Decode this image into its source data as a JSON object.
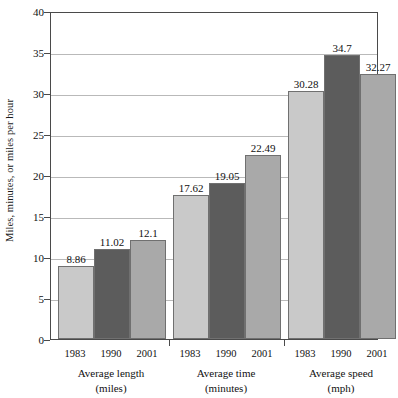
{
  "chart_data": {
    "type": "bar",
    "title": "",
    "subtitle": "",
    "xlabel": "",
    "ylabel": "Miles, minutes, or miles per hour",
    "ylim": [
      0,
      40
    ],
    "ytick_step": 5,
    "yticks": [
      "0",
      "5",
      "10",
      "15",
      "20",
      "25",
      "30",
      "35",
      "40"
    ],
    "grid": true,
    "legend": "none",
    "categories": [
      {
        "line1": "Average length",
        "line2": "(miles)"
      },
      {
        "line1": "Average time",
        "line2": "(minutes)"
      },
      {
        "line1": "Average speed",
        "line2": "(mph)"
      }
    ],
    "series": [
      {
        "name": "1983",
        "color": "#c9c9c9",
        "values": [
          8.86,
          17.62,
          30.28
        ],
        "labels": [
          "8.86",
          "17.62",
          "30.28"
        ]
      },
      {
        "name": "1990",
        "color": "#5c5c5c",
        "values": [
          11.02,
          19.05,
          34.7
        ],
        "labels": [
          "11.02",
          "19.05",
          "34.7"
        ]
      },
      {
        "name": "2001",
        "color": "#a9a9a9",
        "values": [
          12.1,
          22.49,
          32.27
        ],
        "labels": [
          "12.1",
          "22.49",
          "32.27"
        ]
      }
    ],
    "colors": {
      "axis": "#4a4a4a",
      "grid": "#b9b9b9",
      "bar_border": "#707070",
      "text": "#111111",
      "background": "#ffffff"
    }
  }
}
